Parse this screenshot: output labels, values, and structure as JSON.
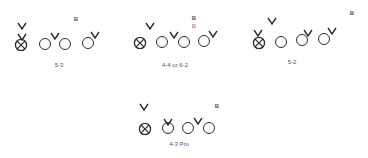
{
  "formations": [
    {
      "id": "5-3",
      "label": "5-3",
      "label_pos": [
        59,
        65
      ],
      "circle_x": [
        [
          21,
          44
        ]
      ],
      "circles": [
        [
          45,
          44
        ],
        [
          65,
          44
        ],
        [
          88,
          43
        ]
      ],
      "vs": [
        [
          22,
          20
        ],
        [
          22,
          31
        ],
        [
          55,
          30
        ],
        [
          95,
          29
        ]
      ],
      "bs": [
        {
          "text": "B",
          "pos": [
            76,
            19
          ],
          "light": false
        }
      ]
    },
    {
      "id": "4-4",
      "label": "4-4 or 6-2",
      "label_pos": [
        175,
        65
      ],
      "circle_x": [
        [
          140,
          42
        ]
      ],
      "circles": [
        [
          162,
          42
        ],
        [
          184,
          42
        ],
        [
          204,
          41
        ]
      ],
      "vs": [
        [
          150,
          20
        ],
        [
          174,
          29
        ],
        [
          213,
          28
        ]
      ],
      "bs": [
        {
          "text": "B",
          "pos": [
            194,
            18
          ],
          "light": false
        },
        {
          "text": "B",
          "pos": [
            194,
            26
          ],
          "light": true
        }
      ]
    },
    {
      "id": "5-2",
      "label": "5-2",
      "label_pos": [
        292,
        62
      ],
      "circle_x": [
        [
          259,
          42
        ]
      ],
      "circles": [
        [
          281,
          42
        ],
        [
          302,
          40
        ],
        [
          324,
          39
        ]
      ],
      "vs": [
        [
          258,
          27
        ],
        [
          272,
          15
        ],
        [
          308,
          27
        ],
        [
          332,
          25
        ]
      ],
      "bs": [
        {
          "text": "B",
          "pos": [
            352,
            13
          ],
          "light": false
        }
      ]
    },
    {
      "id": "4-3-pro",
      "label": "4-3 Pro",
      "label_pos": [
        179,
        144
      ],
      "circle_x": [
        [
          145,
          128
        ]
      ],
      "circles": [
        [
          168,
          128
        ],
        [
          188,
          128
        ],
        [
          209,
          128
        ]
      ],
      "vs": [
        [
          144,
          101
        ],
        [
          168,
          116
        ],
        [
          198,
          115
        ]
      ],
      "bs": [
        {
          "text": "B",
          "pos": [
            217,
            106
          ],
          "light": false
        }
      ]
    }
  ],
  "legend": {
    "circle_x": "center-icon",
    "circle": "offensive-lineman-icon",
    "v": "defender-icon",
    "b": "back-marker"
  },
  "colors": {
    "stroke": "#2e2e2e",
    "label": "#555555",
    "background": "#ffffff"
  }
}
